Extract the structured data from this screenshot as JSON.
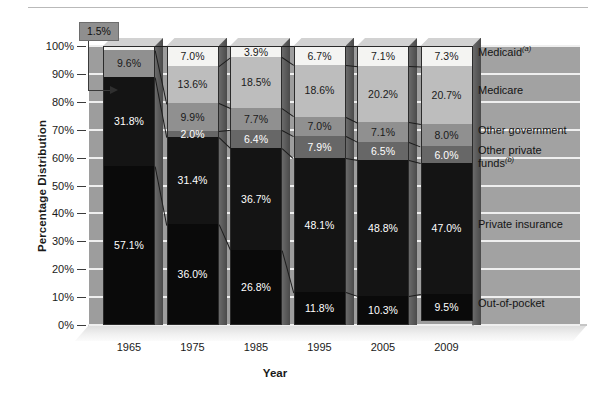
{
  "axes": {
    "y_title": "Percentage Distribution",
    "x_title": "Year",
    "y_ticks": [
      "100%",
      "90%",
      "80%",
      "70%",
      "60%",
      "50%",
      "40%",
      "30%",
      "20%",
      "10%",
      "0%"
    ],
    "x_ticks": [
      "1965",
      "1975",
      "1985",
      "1995",
      "2005",
      "2009"
    ]
  },
  "callout": {
    "label": "1.5%"
  },
  "legend": {
    "items": [
      {
        "name": "medicaid",
        "label": "Medicaid",
        "note": "(a)",
        "color": "#f4f4f2"
      },
      {
        "name": "medicare",
        "label": "Medicare",
        "note": "",
        "color": "#bdbdbd"
      },
      {
        "name": "other-government",
        "label": "Other government",
        "note": "",
        "color": "#909090"
      },
      {
        "name": "other-private-funds",
        "label": "Other private funds",
        "note": "(b)",
        "color": "#676767"
      },
      {
        "name": "private-insurance",
        "label": "Private insurance",
        "note": "",
        "color": "#141414"
      },
      {
        "name": "out-of-pocket",
        "label": "Out-of-pocket",
        "note": "",
        "color": "#0a0a0a"
      }
    ]
  },
  "chart_data": {
    "type": "bar",
    "title": "",
    "xlabel": "Year",
    "ylabel": "Percentage Distribution",
    "ylim": [
      0,
      100
    ],
    "grid": true,
    "legend_position": "right",
    "stacked": true,
    "categories": [
      "1965",
      "1975",
      "1985",
      "1995",
      "2005",
      "2009"
    ],
    "series": [
      {
        "name": "Medicaid",
        "color": "#f4f4f2",
        "values": [
          1.5,
          7.0,
          3.9,
          6.7,
          7.1,
          7.3
        ]
      },
      {
        "name": "Medicare",
        "color": "#bdbdbd",
        "values": [
          0.0,
          13.6,
          18.5,
          18.6,
          20.2,
          20.7
        ]
      },
      {
        "name": "Other government",
        "color": "#909090",
        "values": [
          9.6,
          9.9,
          7.7,
          7.0,
          7.1,
          8.0
        ]
      },
      {
        "name": "Other private funds",
        "color": "#676767",
        "values": [
          0.0,
          2.0,
          6.4,
          7.9,
          6.5,
          6.0
        ]
      },
      {
        "name": "Private insurance",
        "color": "#141414",
        "values": [
          31.8,
          31.4,
          36.7,
          48.1,
          48.8,
          47.0
        ]
      },
      {
        "name": "Out-of-pocket",
        "color": "#0a0a0a",
        "values": [
          57.1,
          36.0,
          26.8,
          11.8,
          10.3,
          9.5
        ]
      }
    ],
    "bars": [
      {
        "year": "1965",
        "segments": [
          {
            "series": "Medicaid",
            "value": 1.5,
            "label": "1.5%",
            "labelled": false
          },
          {
            "series": "Other government",
            "value": 9.6,
            "label": "9.6%",
            "labelled": true
          },
          {
            "series": "Private insurance",
            "value": 31.8,
            "label": "31.8%",
            "labelled": true
          },
          {
            "series": "Out-of-pocket",
            "value": 57.1,
            "label": "57.1%",
            "labelled": true
          }
        ]
      },
      {
        "year": "1975",
        "segments": [
          {
            "series": "Medicaid",
            "value": 7.0,
            "label": "7.0%",
            "labelled": true
          },
          {
            "series": "Medicare",
            "value": 13.6,
            "label": "13.6%",
            "labelled": true
          },
          {
            "series": "Other government",
            "value": 9.9,
            "label": "9.9%",
            "labelled": true
          },
          {
            "series": "Other private funds",
            "value": 2.0,
            "label": "2.0%",
            "labelled": true
          },
          {
            "series": "Private insurance",
            "value": 31.4,
            "label": "31.4%",
            "labelled": true
          },
          {
            "series": "Out-of-pocket",
            "value": 36.0,
            "label": "36.0%",
            "labelled": true
          }
        ]
      },
      {
        "year": "1985",
        "segments": [
          {
            "series": "Medicaid",
            "value": 3.9,
            "label": "3.9%",
            "labelled": true
          },
          {
            "series": "Medicare",
            "value": 18.5,
            "label": "18.5%",
            "labelled": true
          },
          {
            "series": "Other government",
            "value": 7.7,
            "label": "7.7%",
            "labelled": true
          },
          {
            "series": "Other private funds",
            "value": 6.4,
            "label": "6.4%",
            "labelled": true
          },
          {
            "series": "Private insurance",
            "value": 36.7,
            "label": "36.7%",
            "labelled": true
          },
          {
            "series": "Out-of-pocket",
            "value": 26.8,
            "label": "26.8%",
            "labelled": true
          }
        ]
      },
      {
        "year": "1995",
        "segments": [
          {
            "series": "Medicaid",
            "value": 6.7,
            "label": "6.7%",
            "labelled": true
          },
          {
            "series": "Medicare",
            "value": 18.6,
            "label": "18.6%",
            "labelled": true
          },
          {
            "series": "Other government",
            "value": 7.0,
            "label": "7.0%",
            "labelled": true
          },
          {
            "series": "Other private funds",
            "value": 7.9,
            "label": "7.9%",
            "labelled": true
          },
          {
            "series": "Private insurance",
            "value": 48.1,
            "label": "48.1%",
            "labelled": true
          },
          {
            "series": "Out-of-pocket",
            "value": 11.8,
            "label": "11.8%",
            "labelled": true
          }
        ]
      },
      {
        "year": "2005",
        "segments": [
          {
            "series": "Medicaid",
            "value": 7.1,
            "label": "7.1%",
            "labelled": true
          },
          {
            "series": "Medicare",
            "value": 20.2,
            "label": "20.2%",
            "labelled": true
          },
          {
            "series": "Other government",
            "value": 7.1,
            "label": "7.1%",
            "labelled": true
          },
          {
            "series": "Other private funds",
            "value": 6.5,
            "label": "6.5%",
            "labelled": true
          },
          {
            "series": "Private insurance",
            "value": 48.8,
            "label": "48.8%",
            "labelled": true
          },
          {
            "series": "Out-of-pocket",
            "value": 10.3,
            "label": "10.3%",
            "labelled": true
          }
        ]
      },
      {
        "year": "2009",
        "segments": [
          {
            "series": "Medicaid",
            "value": 7.3,
            "label": "7.3%",
            "labelled": true
          },
          {
            "series": "Medicare",
            "value": 20.7,
            "label": "20.7%",
            "labelled": true
          },
          {
            "series": "Other government",
            "value": 8.0,
            "label": "8.0%",
            "labelled": true
          },
          {
            "series": "Other private funds",
            "value": 6.0,
            "label": "6.0%",
            "labelled": true
          },
          {
            "series": "Private insurance",
            "value": 47.0,
            "label": "47.0%",
            "labelled": true
          },
          {
            "series": "Out-of-pocket",
            "value": 9.5,
            "label": "9.5%",
            "labelled": true
          }
        ]
      }
    ]
  }
}
